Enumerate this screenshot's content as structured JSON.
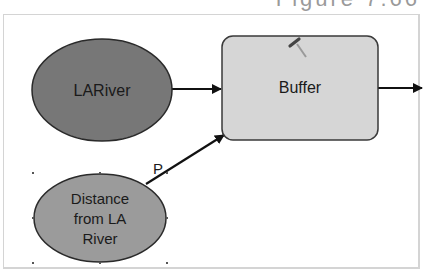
{
  "caption": "Figure 7.66",
  "colors": {
    "input_data_fill": "#777777",
    "variable_fill": "#9b9b9b",
    "tool_fill": "#d6d6d6",
    "stroke": "#2a2a2a",
    "connector": "#111111"
  },
  "nodes": {
    "input": {
      "label": "LARiver",
      "shape": "ellipse"
    },
    "parameter": {
      "label_lines": [
        "Distance",
        "from LA",
        "River"
      ],
      "shape": "ellipse",
      "selected": true
    },
    "tool": {
      "label": "Buffer",
      "shape": "rounded-rectangle",
      "icon": "hammer-icon"
    }
  },
  "connectors": [
    {
      "from": "LARiver",
      "to": "Buffer",
      "label": ""
    },
    {
      "from": "Distance from LA River",
      "to": "Buffer",
      "label": "P"
    },
    {
      "from": "Buffer",
      "to": "output",
      "label": ""
    }
  ]
}
